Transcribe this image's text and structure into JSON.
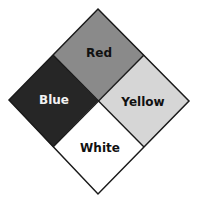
{
  "diagram": {
    "type": "hazard-diamond",
    "quadrants": [
      {
        "position": "top",
        "label": "Red",
        "fill": "#8a8a8a",
        "text_color": "#111111"
      },
      {
        "position": "left",
        "label": "Blue",
        "fill": "#262626",
        "text_color": "#f2f2f2"
      },
      {
        "position": "right",
        "label": "Yellow",
        "fill": "#d6d6d6",
        "text_color": "#111111"
      },
      {
        "position": "bottom",
        "label": "White",
        "fill": "#ffffff",
        "text_color": "#111111"
      }
    ],
    "border_color": "#1a1a1a"
  }
}
